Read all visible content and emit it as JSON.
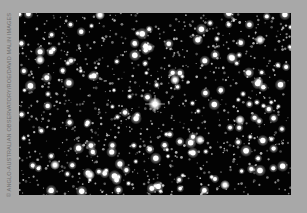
{
  "image": {
    "subject": "Dense star field (astronomical photograph)",
    "background_color": "#a8a8a8",
    "sky_color": "#030303",
    "star_color": "#ffffff",
    "bright_star": {
      "x": 136,
      "y": 91,
      "label": "central bright star with diffraction spikes"
    }
  },
  "credit": {
    "text": "© ANGLO-AUSTRALIAN OBSERVATORY/ROE/DAVID MALIN IMAGES"
  }
}
